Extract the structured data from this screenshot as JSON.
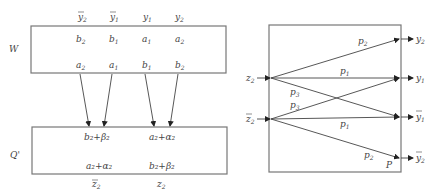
{
  "left_diagram": {
    "top_box_label": "W",
    "bottom_box_label": "Q'",
    "top_column_headers": [
      {
        "base": "y",
        "sub": "2",
        "bar": true
      },
      {
        "base": "y",
        "sub": "1",
        "bar": true
      },
      {
        "base": "y",
        "sub": "1",
        "bar": false
      },
      {
        "base": "y",
        "sub": "2",
        "bar": false
      }
    ],
    "top_row1": [
      {
        "base": "b",
        "sub": "2"
      },
      {
        "base": "b",
        "sub": "1"
      },
      {
        "base": "a",
        "sub": "1"
      },
      {
        "base": "a",
        "sub": "2"
      }
    ],
    "top_row2": [
      {
        "base": "a",
        "sub": "2"
      },
      {
        "base": "a",
        "sub": "1"
      },
      {
        "base": "b",
        "sub": "1"
      },
      {
        "base": "b",
        "sub": "2"
      }
    ],
    "bottom_row1": [
      "b₂+β₂",
      "a₂+α₂"
    ],
    "bottom_row2": [
      "a₂+α₂",
      "b₂+β₂"
    ],
    "bottom_column_footers": [
      {
        "base": "z",
        "sub": "2",
        "bar": true
      },
      {
        "base": "z",
        "sub": "2",
        "bar": false
      }
    ]
  },
  "right_diagram": {
    "box_label": "P",
    "inputs": [
      {
        "base": "z",
        "sub": "2",
        "bar": false
      },
      {
        "base": "z",
        "sub": "2",
        "bar": true
      }
    ],
    "outputs": [
      {
        "base": "y",
        "sub": "2",
        "bar": false
      },
      {
        "base": "y",
        "sub": "1",
        "bar": false
      },
      {
        "base": "y",
        "sub": "1",
        "bar": true
      },
      {
        "base": "y",
        "sub": "2",
        "bar": true
      }
    ],
    "edges": [
      {
        "from": "z2",
        "to": "y2",
        "label": "p",
        "sub": "2"
      },
      {
        "from": "z2",
        "to": "y1",
        "label": "p",
        "sub": "1"
      },
      {
        "from": "z2",
        "to": "ybar1",
        "label": "p",
        "sub": "3"
      },
      {
        "from": "zbar2",
        "to": "y1",
        "label": "p",
        "sub": "3"
      },
      {
        "from": "zbar2",
        "to": "ybar1",
        "label": "p",
        "sub": "1"
      },
      {
        "from": "zbar2",
        "to": "ybar2",
        "label": "p",
        "sub": "2"
      }
    ]
  }
}
